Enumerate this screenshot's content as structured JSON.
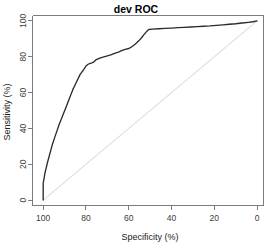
{
  "chart_data": {
    "type": "line",
    "title": "dev ROC",
    "xlabel": "Specificity (%)",
    "ylabel": "Sensitivity (%)",
    "xlim": [
      105,
      -3
    ],
    "ylim": [
      -3,
      103
    ],
    "x_reversed": true,
    "grid": false,
    "legend": null,
    "xticks": [
      100,
      80,
      60,
      40,
      20,
      0
    ],
    "xtick_labels": [
      "100",
      "80",
      "60",
      "40",
      "20",
      "0"
    ],
    "yticks": [
      0,
      20,
      40,
      60,
      80,
      100
    ],
    "ytick_labels": [
      "0",
      "20",
      "40",
      "60",
      "80",
      "100"
    ],
    "series": [
      {
        "name": "ROC curve",
        "color": "#2b2b2b",
        "x": [
          100.0,
          100.0,
          99.6,
          99.2,
          98.6,
          98.0,
          97.2,
          96.4,
          95.6,
          94.6,
          93.6,
          92.6,
          91.6,
          90.6,
          89.6,
          88.6,
          87.8,
          87.0,
          86.2,
          85.4,
          84.6,
          84.0,
          83.4,
          82.8,
          82.2,
          81.6,
          81.0,
          80.4,
          80.0,
          79.0,
          78.0,
          77.2,
          76.4,
          75.4,
          74.4,
          73.2,
          72.0,
          70.8,
          69.6,
          68.4,
          67.2,
          66.0,
          64.8,
          63.6,
          62.4,
          61.2,
          60.0,
          58.8,
          57.6,
          56.4,
          55.2,
          54.0,
          53.0,
          52.0,
          51.2,
          50.6,
          49.0,
          46.0,
          43.0,
          40.0,
          37.0,
          34.0,
          31.0,
          28.0,
          25.0,
          22.0,
          19.0,
          16.0,
          13.0,
          10.0,
          7.0,
          4.0,
          2.0,
          0.5,
          0.0
        ],
        "y": [
          0.0,
          9.5,
          12.0,
          15.0,
          18.0,
          21.0,
          24.5,
          28.0,
          31.5,
          35.0,
          38.5,
          42.0,
          45.0,
          48.0,
          51.0,
          54.0,
          56.5,
          59.0,
          61.5,
          63.5,
          65.5,
          67.0,
          68.5,
          70.0,
          71.0,
          72.0,
          73.0,
          74.0,
          74.8,
          75.8,
          76.3,
          76.6,
          77.0,
          78.2,
          78.8,
          79.4,
          79.8,
          80.2,
          80.6,
          81.0,
          81.6,
          82.2,
          82.6,
          83.2,
          83.8,
          84.2,
          84.6,
          85.4,
          86.4,
          87.6,
          89.0,
          90.6,
          92.2,
          93.6,
          94.6,
          95.2,
          95.4,
          95.6,
          95.8,
          96.0,
          96.2,
          96.4,
          96.6,
          96.8,
          97.0,
          97.2,
          97.5,
          97.8,
          98.1,
          98.4,
          98.8,
          99.2,
          99.5,
          99.9,
          100.0
        ]
      }
    ],
    "reference_line": {
      "name": "chance-diagonal",
      "color": "#dddddd",
      "x": [
        100.0,
        0.0
      ],
      "y": [
        0.0,
        100.0
      ]
    }
  },
  "plot": {
    "title": "dev ROC",
    "x_axis_title": "Specificity (%)",
    "y_axis_title": "Sensitivity (%)"
  }
}
